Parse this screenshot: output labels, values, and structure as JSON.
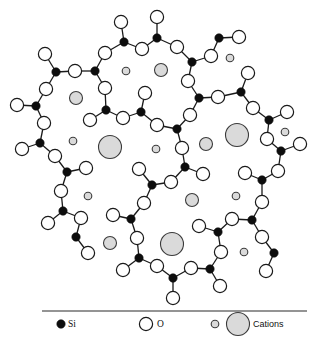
{
  "figure": {
    "legend": {
      "si_label": "Si",
      "o_label": "O",
      "cations_label": "Cations"
    },
    "caption_partial": "(caption text cut off at bottom edge)"
  },
  "colors": {
    "si": "#0d0d0d",
    "o_fill": "#ffffff",
    "cation_fill": "#dadada",
    "line": "#1a1a1a"
  },
  "sizes": {
    "si_r": 4.2,
    "o_r": 6.6,
    "cation_small_r": 3.8,
    "cation_medium_r": 6.5,
    "cation_large_r": 11.5
  },
  "si_atoms": [
    [
      124,
      42
    ],
    [
      157,
      38
    ],
    [
      219,
      38
    ],
    [
      192,
      62
    ],
    [
      56,
      72
    ],
    [
      95,
      71
    ],
    [
      36,
      106
    ],
    [
      106,
      110
    ],
    [
      141,
      112
    ],
    [
      199,
      98
    ],
    [
      241,
      92
    ],
    [
      269,
      120
    ],
    [
      177,
      129
    ],
    [
      40,
      143
    ],
    [
      67,
      172
    ],
    [
      152,
      185
    ],
    [
      185,
      167
    ],
    [
      281,
      151
    ],
    [
      262,
      180
    ],
    [
      63,
      211
    ],
    [
      76,
      237
    ],
    [
      131,
      219
    ],
    [
      252,
      220
    ],
    [
      218,
      232
    ],
    [
      274,
      253
    ],
    [
      139,
      258
    ],
    [
      173,
      278
    ],
    [
      210,
      269
    ]
  ],
  "o_atoms": [
    [
      121,
      22
    ],
    [
      157,
      17
    ],
    [
      142,
      49
    ],
    [
      177,
      47
    ],
    [
      211,
      56
    ],
    [
      239,
      37
    ],
    [
      45,
      54
    ],
    [
      75,
      71
    ],
    [
      105,
      53
    ],
    [
      105,
      88
    ],
    [
      46,
      89
    ],
    [
      17,
      105
    ],
    [
      44,
      123
    ],
    [
      90,
      120
    ],
    [
      123,
      118
    ],
    [
      145,
      93
    ],
    [
      188,
      81
    ],
    [
      218,
      97
    ],
    [
      248,
      73
    ],
    [
      253,
      108
    ],
    [
      287,
      112
    ],
    [
      190,
      115
    ],
    [
      157,
      125
    ],
    [
      22,
      149
    ],
    [
      55,
      156
    ],
    [
      86,
      168
    ],
    [
      61,
      191
    ],
    [
      139,
      169
    ],
    [
      144,
      203
    ],
    [
      182,
      148
    ],
    [
      203,
      174
    ],
    [
      171,
      182
    ],
    [
      267,
      139
    ],
    [
      300,
      144
    ],
    [
      278,
      171
    ],
    [
      245,
      173
    ],
    [
      262,
      202
    ],
    [
      48,
      223
    ],
    [
      81,
      218
    ],
    [
      88,
      253
    ],
    [
      113,
      215
    ],
    [
      137,
      238
    ],
    [
      232,
      219
    ],
    [
      199,
      226
    ],
    [
      262,
      237
    ],
    [
      221,
      252
    ],
    [
      266,
      271
    ],
    [
      123,
      270
    ],
    [
      157,
      266
    ],
    [
      191,
      268
    ],
    [
      220,
      286
    ],
    [
      173,
      298
    ]
  ],
  "bonds": [
    [
      [
        121,
        22
      ],
      [
        124,
        42
      ]
    ],
    [
      [
        124,
        42
      ],
      [
        142,
        49
      ]
    ],
    [
      [
        124,
        42
      ],
      [
        105,
        53
      ]
    ],
    [
      [
        142,
        49
      ],
      [
        157,
        38
      ]
    ],
    [
      [
        157,
        38
      ],
      [
        157,
        17
      ]
    ],
    [
      [
        157,
        38
      ],
      [
        177,
        47
      ]
    ],
    [
      [
        177,
        47
      ],
      [
        192,
        62
      ]
    ],
    [
      [
        192,
        62
      ],
      [
        211,
        56
      ]
    ],
    [
      [
        211,
        56
      ],
      [
        219,
        38
      ]
    ],
    [
      [
        219,
        38
      ],
      [
        239,
        37
      ]
    ],
    [
      [
        192,
        62
      ],
      [
        188,
        81
      ]
    ],
    [
      [
        105,
        53
      ],
      [
        95,
        71
      ]
    ],
    [
      [
        95,
        71
      ],
      [
        75,
        71
      ]
    ],
    [
      [
        75,
        71
      ],
      [
        56,
        72
      ]
    ],
    [
      [
        56,
        72
      ],
      [
        45,
        54
      ]
    ],
    [
      [
        56,
        72
      ],
      [
        46,
        89
      ]
    ],
    [
      [
        95,
        71
      ],
      [
        105,
        88
      ]
    ],
    [
      [
        46,
        89
      ],
      [
        36,
        106
      ]
    ],
    [
      [
        36,
        106
      ],
      [
        17,
        105
      ]
    ],
    [
      [
        36,
        106
      ],
      [
        44,
        123
      ]
    ],
    [
      [
        44,
        123
      ],
      [
        40,
        143
      ]
    ],
    [
      [
        105,
        88
      ],
      [
        106,
        110
      ]
    ],
    [
      [
        106,
        110
      ],
      [
        90,
        120
      ]
    ],
    [
      [
        106,
        110
      ],
      [
        123,
        118
      ]
    ],
    [
      [
        123,
        118
      ],
      [
        141,
        112
      ]
    ],
    [
      [
        141,
        112
      ],
      [
        145,
        93
      ]
    ],
    [
      [
        141,
        112
      ],
      [
        157,
        125
      ]
    ],
    [
      [
        157,
        125
      ],
      [
        177,
        129
      ]
    ],
    [
      [
        177,
        129
      ],
      [
        190,
        115
      ]
    ],
    [
      [
        190,
        115
      ],
      [
        199,
        98
      ]
    ],
    [
      [
        199,
        98
      ],
      [
        188,
        81
      ]
    ],
    [
      [
        199,
        98
      ],
      [
        218,
        97
      ]
    ],
    [
      [
        218,
        97
      ],
      [
        241,
        92
      ]
    ],
    [
      [
        241,
        92
      ],
      [
        248,
        73
      ]
    ],
    [
      [
        241,
        92
      ],
      [
        253,
        108
      ]
    ],
    [
      [
        253,
        108
      ],
      [
        269,
        120
      ]
    ],
    [
      [
        269,
        120
      ],
      [
        287,
        112
      ]
    ],
    [
      [
        269,
        120
      ],
      [
        267,
        139
      ]
    ],
    [
      [
        267,
        139
      ],
      [
        281,
        151
      ]
    ],
    [
      [
        281,
        151
      ],
      [
        300,
        144
      ]
    ],
    [
      [
        281,
        151
      ],
      [
        278,
        171
      ]
    ],
    [
      [
        278,
        171
      ],
      [
        262,
        180
      ]
    ],
    [
      [
        262,
        180
      ],
      [
        245,
        173
      ]
    ],
    [
      [
        262,
        180
      ],
      [
        262,
        202
      ]
    ],
    [
      [
        262,
        202
      ],
      [
        252,
        220
      ]
    ],
    [
      [
        252,
        220
      ],
      [
        232,
        219
      ]
    ],
    [
      [
        252,
        220
      ],
      [
        262,
        237
      ]
    ],
    [
      [
        262,
        237
      ],
      [
        274,
        253
      ]
    ],
    [
      [
        274,
        253
      ],
      [
        266,
        271
      ]
    ],
    [
      [
        232,
        219
      ],
      [
        218,
        232
      ]
    ],
    [
      [
        218,
        232
      ],
      [
        199,
        226
      ]
    ],
    [
      [
        218,
        232
      ],
      [
        221,
        252
      ]
    ],
    [
      [
        221,
        252
      ],
      [
        210,
        269
      ]
    ],
    [
      [
        210,
        269
      ],
      [
        220,
        286
      ]
    ],
    [
      [
        210,
        269
      ],
      [
        191,
        268
      ]
    ],
    [
      [
        191,
        268
      ],
      [
        173,
        278
      ]
    ],
    [
      [
        173,
        278
      ],
      [
        173,
        298
      ]
    ],
    [
      [
        173,
        278
      ],
      [
        157,
        266
      ]
    ],
    [
      [
        157,
        266
      ],
      [
        139,
        258
      ]
    ],
    [
      [
        139,
        258
      ],
      [
        123,
        270
      ]
    ],
    [
      [
        139,
        258
      ],
      [
        137,
        238
      ]
    ],
    [
      [
        137,
        238
      ],
      [
        131,
        219
      ]
    ],
    [
      [
        131,
        219
      ],
      [
        113,
        215
      ]
    ],
    [
      [
        131,
        219
      ],
      [
        144,
        203
      ]
    ],
    [
      [
        144,
        203
      ],
      [
        152,
        185
      ]
    ],
    [
      [
        152,
        185
      ],
      [
        139,
        169
      ]
    ],
    [
      [
        152,
        185
      ],
      [
        171,
        182
      ]
    ],
    [
      [
        177,
        129
      ],
      [
        182,
        148
      ]
    ],
    [
      [
        182,
        148
      ],
      [
        185,
        167
      ]
    ],
    [
      [
        185,
        167
      ],
      [
        203,
        174
      ]
    ],
    [
      [
        185,
        167
      ],
      [
        171,
        182
      ]
    ],
    [
      [
        40,
        143
      ],
      [
        22,
        149
      ]
    ],
    [
      [
        40,
        143
      ],
      [
        55,
        156
      ]
    ],
    [
      [
        55,
        156
      ],
      [
        67,
        172
      ]
    ],
    [
      [
        67,
        172
      ],
      [
        86,
        168
      ]
    ],
    [
      [
        67,
        172
      ],
      [
        61,
        191
      ]
    ],
    [
      [
        61,
        191
      ],
      [
        63,
        211
      ]
    ],
    [
      [
        63,
        211
      ],
      [
        48,
        223
      ]
    ],
    [
      [
        63,
        211
      ],
      [
        81,
        218
      ]
    ],
    [
      [
        81,
        218
      ],
      [
        76,
        237
      ]
    ],
    [
      [
        76,
        237
      ],
      [
        88,
        253
      ]
    ]
  ],
  "cations": [
    {
      "pos": [
        126,
        71
      ],
      "size": "small"
    },
    {
      "pos": [
        230,
        58
      ],
      "size": "small"
    },
    {
      "pos": [
        161,
        70
      ],
      "size": "medium"
    },
    {
      "pos": [
        76,
        98
      ],
      "size": "medium"
    },
    {
      "pos": [
        285,
        132
      ],
      "size": "small"
    },
    {
      "pos": [
        237,
        135
      ],
      "size": "large"
    },
    {
      "pos": [
        73,
        141
      ],
      "size": "small"
    },
    {
      "pos": [
        110,
        147
      ],
      "size": "large"
    },
    {
      "pos": [
        156,
        149
      ],
      "size": "small"
    },
    {
      "pos": [
        206,
        144
      ],
      "size": "medium"
    },
    {
      "pos": [
        88,
        196
      ],
      "size": "small"
    },
    {
      "pos": [
        192,
        200
      ],
      "size": "medium"
    },
    {
      "pos": [
        236,
        196
      ],
      "size": "small"
    },
    {
      "pos": [
        110,
        243
      ],
      "size": "medium"
    },
    {
      "pos": [
        172,
        244
      ],
      "size": "large"
    },
    {
      "pos": [
        244,
        252
      ],
      "size": "small"
    }
  ],
  "legend_layout": {
    "divider": [
      [
        42,
        311
      ],
      [
        307,
        311
      ]
    ],
    "si_dot": [
      61,
      324
    ],
    "si_text": [
      68,
      327
    ],
    "o_circle": [
      146,
      324
    ],
    "o_text": [
      157,
      327
    ],
    "cation_small": [
      215,
      324
    ],
    "cation_large": [
      238,
      324
    ],
    "cations_text": [
      253,
      327
    ]
  }
}
